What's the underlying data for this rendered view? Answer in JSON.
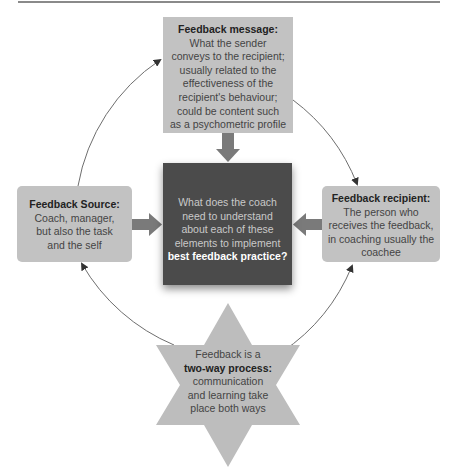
{
  "diagram": {
    "title": "",
    "colors": {
      "box_fill": "#c2c2c2",
      "center_fill": "#4b4b4b",
      "arrow_fill": "#7a7a7a",
      "star_fill": "#bdbdbd",
      "circle_stroke": "#6e6e6e"
    },
    "top_box": {
      "heading": "Feedback message:",
      "lines": [
        "What the sender",
        "conveys to the recipient;",
        "usually related to the",
        "effectiveness of the",
        "recipient's behaviour;",
        "could be content such",
        "as a psychometric profile"
      ]
    },
    "center_box": {
      "lines": [
        "What does the coach",
        "need to understand",
        "about each of these",
        "elements to implement"
      ],
      "emphasis": "best feedback practice?"
    },
    "left_box": {
      "heading": "Feedback Source:",
      "lines": [
        "Coach, manager,",
        "but also the task",
        "and the self"
      ]
    },
    "right_box": {
      "heading": "Feedback recipient:",
      "lines": [
        "The person who",
        "receives the feedback,",
        "in coaching usually the",
        "coachee"
      ]
    },
    "star": {
      "line1": "Feedback is a",
      "emphasis": "two-way process:",
      "lines": [
        "communication",
        "and learning take",
        "place both ways"
      ]
    }
  }
}
